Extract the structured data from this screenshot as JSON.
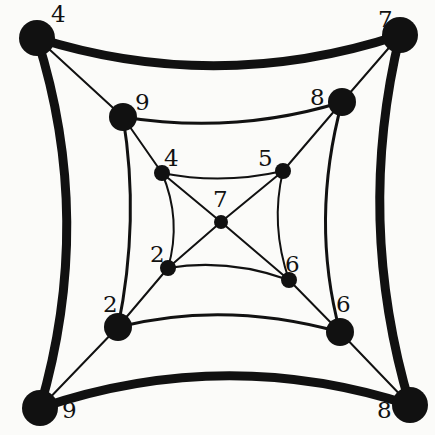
{
  "diagram": {
    "background": "#fbfbf9",
    "ink": "#111111",
    "nodes": [
      {
        "id": "outer-tl",
        "label": "4",
        "x": 37,
        "y": 38,
        "r": 18,
        "lx": 51,
        "ly": 22
      },
      {
        "id": "outer-tr",
        "label": "7",
        "x": 400,
        "y": 35,
        "r": 18,
        "lx": 378,
        "ly": 27
      },
      {
        "id": "outer-bl",
        "label": "9",
        "x": 40,
        "y": 408,
        "r": 18,
        "lx": 62,
        "ly": 418
      },
      {
        "id": "outer-br",
        "label": "8",
        "x": 410,
        "y": 405,
        "r": 18,
        "lx": 377,
        "ly": 418
      },
      {
        "id": "mid-tl",
        "label": "9",
        "x": 123,
        "y": 117,
        "r": 14,
        "lx": 135,
        "ly": 110
      },
      {
        "id": "mid-tr",
        "label": "8",
        "x": 342,
        "y": 102,
        "r": 14,
        "lx": 310,
        "ly": 105
      },
      {
        "id": "mid-bl",
        "label": "2",
        "x": 118,
        "y": 327,
        "r": 14,
        "lx": 103,
        "ly": 312
      },
      {
        "id": "mid-br",
        "label": "6",
        "x": 340,
        "y": 332,
        "r": 14,
        "lx": 336,
        "ly": 312
      },
      {
        "id": "inner-tl",
        "label": "4",
        "x": 162,
        "y": 173,
        "r": 8,
        "lx": 164,
        "ly": 166
      },
      {
        "id": "inner-tr",
        "label": "5",
        "x": 283,
        "y": 171,
        "r": 8,
        "lx": 258,
        "ly": 166
      },
      {
        "id": "inner-bl",
        "label": "2",
        "x": 168,
        "y": 268,
        "r": 8,
        "lx": 150,
        "ly": 262
      },
      {
        "id": "inner-br",
        "label": "6",
        "x": 289,
        "y": 280,
        "r": 8,
        "lx": 285,
        "ly": 272
      },
      {
        "id": "center",
        "label": "7",
        "x": 221,
        "y": 222,
        "r": 7,
        "lx": 213,
        "ly": 207
      }
    ],
    "edges": [
      {
        "from": "outer-tl",
        "to": "outer-tr",
        "width": 9,
        "curve": "M37,38 Q218,95 400,35"
      },
      {
        "from": "outer-tr",
        "to": "outer-br",
        "width": 9,
        "curve": "M400,35 Q355,220 410,405"
      },
      {
        "from": "outer-br",
        "to": "outer-bl",
        "width": 9,
        "curve": "M410,405 Q225,345 40,408"
      },
      {
        "from": "outer-bl",
        "to": "outer-tl",
        "width": 9,
        "curve": "M40,408 Q95,220 37,38"
      },
      {
        "from": "mid-tl",
        "to": "mid-tr",
        "width": 3,
        "curve": "M123,117 Q235,135 342,102"
      },
      {
        "from": "mid-tr",
        "to": "mid-br",
        "width": 3,
        "curve": "M342,102 Q310,220 340,332"
      },
      {
        "from": "mid-br",
        "to": "mid-bl",
        "width": 3,
        "curve": "M340,332 Q225,300 118,327"
      },
      {
        "from": "mid-bl",
        "to": "mid-tl",
        "width": 3,
        "curve": "M118,327 Q140,220 123,117"
      },
      {
        "from": "inner-tl",
        "to": "inner-tr",
        "width": 2,
        "curve": "M162,173 Q222,185 283,171"
      },
      {
        "from": "inner-tr",
        "to": "inner-br",
        "width": 2,
        "curve": "M283,171 Q270,225 289,280"
      },
      {
        "from": "inner-br",
        "to": "inner-bl",
        "width": 2,
        "curve": "M289,280 Q228,258 168,268"
      },
      {
        "from": "inner-bl",
        "to": "inner-tl",
        "width": 2,
        "curve": "M168,268 Q182,220 162,173"
      },
      {
        "from": "outer-tl",
        "to": "mid-tl",
        "width": 2,
        "curve": "M37,38 L123,117"
      },
      {
        "from": "mid-tl",
        "to": "inner-tl",
        "width": 2,
        "curve": "M123,117 L162,173"
      },
      {
        "from": "inner-tl",
        "to": "center",
        "width": 2,
        "curve": "M162,173 L221,222"
      },
      {
        "from": "outer-tr",
        "to": "mid-tr",
        "width": 2,
        "curve": "M400,35 L342,102"
      },
      {
        "from": "mid-tr",
        "to": "inner-tr",
        "width": 2,
        "curve": "M342,102 L283,171"
      },
      {
        "from": "inner-tr",
        "to": "center",
        "width": 2,
        "curve": "M283,171 L221,222"
      },
      {
        "from": "outer-bl",
        "to": "mid-bl",
        "width": 2,
        "curve": "M40,408 L118,327"
      },
      {
        "from": "mid-bl",
        "to": "inner-bl",
        "width": 2,
        "curve": "M118,327 L168,268"
      },
      {
        "from": "inner-bl",
        "to": "center",
        "width": 2,
        "curve": "M168,268 L221,222"
      },
      {
        "from": "outer-br",
        "to": "mid-br",
        "width": 2,
        "curve": "M410,405 L340,332"
      },
      {
        "from": "mid-br",
        "to": "inner-br",
        "width": 2,
        "curve": "M340,332 L289,280"
      },
      {
        "from": "inner-br",
        "to": "center",
        "width": 2,
        "curve": "M289,280 L221,222"
      }
    ]
  }
}
